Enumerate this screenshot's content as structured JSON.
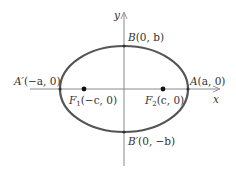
{
  "diagram": {
    "type": "ellipse",
    "center": [
      0,
      0
    ],
    "axes": {
      "x_label": "x",
      "y_label": "y"
    },
    "points": {
      "vertex_right": {
        "name": "A",
        "coords": "(a, 0)"
      },
      "vertex_left": {
        "name": "A′",
        "coords": "(−a, 0)"
      },
      "covertex_top": {
        "name": "B",
        "coords": "(0, b)"
      },
      "covertex_bottom": {
        "name": "B′",
        "coords": "(0, −b)"
      },
      "focus_left": {
        "name": "F",
        "sub": "1",
        "coords": "(−c, 0)"
      },
      "focus_right": {
        "name": "F",
        "sub": "2",
        "coords": "(c, 0)"
      }
    },
    "colors": {
      "ellipse": "#555555",
      "axes": "#888888",
      "points": "#111111",
      "text": "#333333"
    }
  }
}
